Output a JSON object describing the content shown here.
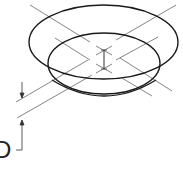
{
  "diagram": {
    "type": "isometric technical drawing",
    "colors": {
      "outline": "#1a1a1a",
      "centerline": "#666666",
      "background": "#ffffff"
    },
    "dimension": {
      "label": "D"
    }
  }
}
